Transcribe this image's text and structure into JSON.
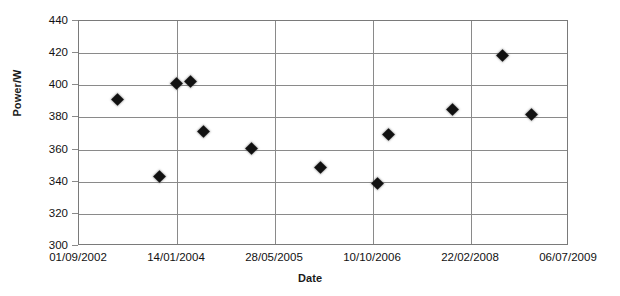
{
  "chart_data": {
    "type": "scatter",
    "title": "",
    "xlabel": "Date",
    "ylabel": "Power/W",
    "ylim": [
      300,
      440
    ],
    "y_ticks": [
      300,
      320,
      340,
      360,
      380,
      400,
      420,
      440
    ],
    "x_tick_labels": [
      "01/09/2002",
      "14/01/2004",
      "28/05/2005",
      "10/10/2006",
      "22/02/2008",
      "06/07/2009"
    ],
    "grid": "both",
    "legend": "none",
    "marker_shape": "diamond",
    "marker_color": "#111111",
    "series": [
      {
        "name": "Power",
        "points": [
          {
            "date": "25/04/2003",
            "x_frac": 0.0816,
            "value": 390.5
          },
          {
            "date": "07/01/2004",
            "x_frac": 0.202,
            "value": 400.8
          },
          {
            "date": "11/03/2004",
            "x_frac": 0.2286,
            "value": 401.5
          },
          {
            "date": "27/06/2004",
            "x_frac": 0.2571,
            "value": 370.5
          },
          {
            "date": "06/02/2004",
            "x_frac": 0.1673,
            "value": 342.5
          },
          {
            "date": "25/08/2005",
            "x_frac": 0.3551,
            "value": 360.0
          },
          {
            "date": "26/09/2006",
            "x_frac": 0.4939,
            "value": 348.0
          },
          {
            "date": "14/11/2006",
            "x_frac": 0.6122,
            "value": 338.5
          },
          {
            "date": "02/02/2007",
            "x_frac": 0.6327,
            "value": 369.0
          },
          {
            "date": "22/11/2007",
            "x_frac": 0.7633,
            "value": 384.5
          },
          {
            "date": "25/10/2008",
            "x_frac": 0.8673,
            "value": 418.0
          },
          {
            "date": "19/04/2009",
            "x_frac": 0.9245,
            "value": 381.0
          }
        ]
      }
    ]
  }
}
